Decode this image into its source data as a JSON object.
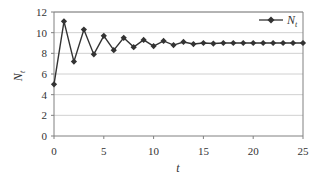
{
  "chart_data": {
    "type": "line",
    "title": "",
    "xlabel": "t",
    "ylabel": "N_t",
    "xlim": [
      0,
      25
    ],
    "ylim": [
      0,
      12
    ],
    "x_ticks": [
      0,
      5,
      10,
      15,
      20,
      25
    ],
    "y_ticks": [
      0,
      2,
      4,
      6,
      8,
      10,
      12
    ],
    "grid": {
      "horizontal": true,
      "vertical": false
    },
    "legend": {
      "position": "top-right",
      "entries": [
        "N_t"
      ]
    },
    "series": [
      {
        "name": "N_t",
        "color": "#333333",
        "marker": "diamond",
        "x": [
          0,
          1,
          2,
          3,
          4,
          5,
          6,
          7,
          8,
          9,
          10,
          11,
          12,
          13,
          14,
          15,
          16,
          17,
          18,
          19,
          20,
          21,
          22,
          23,
          24,
          25
        ],
        "values": [
          5.0,
          11.1,
          7.2,
          10.3,
          7.9,
          9.7,
          8.3,
          9.5,
          8.6,
          9.3,
          8.7,
          9.2,
          8.8,
          9.1,
          8.9,
          9.0,
          8.95,
          9.0,
          9.0,
          9.0,
          9.0,
          9.0,
          9.0,
          9.0,
          9.0,
          9.0
        ]
      }
    ]
  },
  "labels": {
    "ylabel_main": "N",
    "ylabel_sub": "t",
    "xlabel": "t",
    "legend_main": "N",
    "legend_sub": "t"
  },
  "colors": {
    "line": "#333333",
    "grid": "#d0d0d0",
    "axis": "#808080",
    "text": "#333333"
  }
}
